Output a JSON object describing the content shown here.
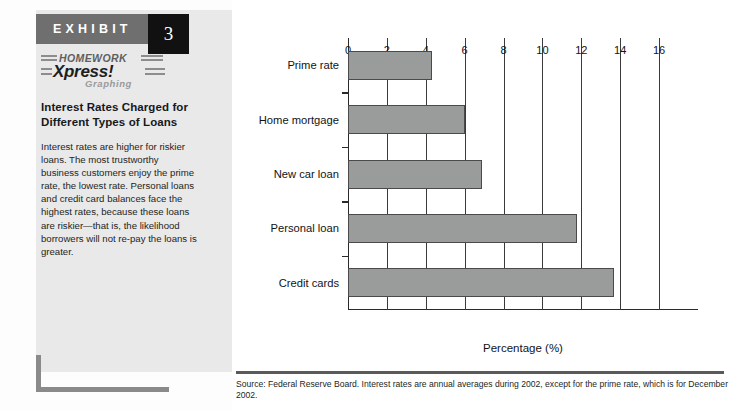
{
  "exhibit": {
    "word": "EXHIBIT",
    "number": "3",
    "logo_line1": "HOMEWORK",
    "logo_line2": "Xpress!",
    "logo_line3": "Graphing",
    "title": "Interest Rates Charged for Different Types of Loans",
    "body": "Interest rates are higher for riskier loans. The most trustworthy business customers enjoy the prime rate, the lowest rate. Personal loans and credit card balances face the highest rates, because these loans are riskier—that is, the likelihood borrowers will not re-pay the loans is greater."
  },
  "source": {
    "text": "Source: Federal Reserve Board. Interest rates are annual averages during 2002, except for the prime rate, which is for December 2002."
  },
  "colors": {
    "header_bar": "#6f6f6f",
    "number_box": "#111111",
    "panel_bg": "#e9e9e9",
    "bar_fill": "#9a9b9b",
    "bar_stroke": "#4a4a4a",
    "accent": "#8a8a8a"
  },
  "chart_data": {
    "type": "bar",
    "orientation": "horizontal",
    "title": "",
    "xlabel": "Percentage (%)",
    "ylabel": "",
    "categories": [
      "Prime rate",
      "Home mortgage",
      "New car loan",
      "Personal loan",
      "Credit cards"
    ],
    "values": [
      4.3,
      6.0,
      6.9,
      11.8,
      13.7
    ],
    "xlim": [
      0,
      18
    ],
    "xticks": [
      0,
      2,
      4,
      6,
      8,
      10,
      12,
      14,
      16
    ],
    "xtick_labels": [
      "0",
      "2",
      "4",
      "6",
      "8",
      "10",
      "12",
      "14",
      "16"
    ],
    "grid": "vertical",
    "legend": "none"
  }
}
